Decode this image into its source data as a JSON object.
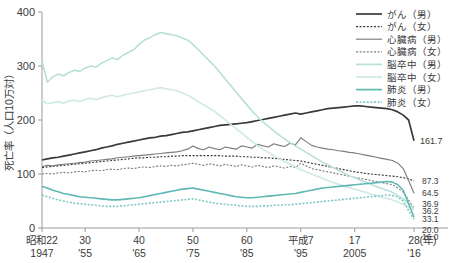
{
  "chart_data": {
    "type": "line",
    "title": "",
    "xlabel": "(年)",
    "ylabel": "死亡率（人口10万対）",
    "ylim": [
      0,
      400
    ],
    "yticks": [
      0,
      100,
      200,
      300,
      400
    ],
    "ytick_labels": [
      "0",
      "100",
      "200",
      "300",
      "400"
    ],
    "grid": false,
    "legend_position": "top-right",
    "xlim": [
      1947,
      2016
    ],
    "xticks": [
      1947,
      1955,
      1965,
      1975,
      1985,
      1995,
      2005,
      2016
    ],
    "xtick_labels_era": [
      "昭和22",
      "30",
      "40",
      "50",
      "60",
      "平成7",
      "17",
      "28"
    ],
    "xtick_labels_western": [
      "1947",
      "'55",
      "'65",
      "'75",
      "'85",
      "'95",
      "2005",
      "'16"
    ],
    "xaxis_unit": "(年)",
    "x": [
      1947,
      1948,
      1949,
      1950,
      1951,
      1952,
      1953,
      1954,
      1955,
      1956,
      1957,
      1958,
      1959,
      1960,
      1961,
      1962,
      1963,
      1964,
      1965,
      1966,
      1967,
      1968,
      1969,
      1970,
      1971,
      1972,
      1973,
      1974,
      1975,
      1976,
      1977,
      1978,
      1979,
      1980,
      1981,
      1982,
      1983,
      1984,
      1985,
      1986,
      1987,
      1988,
      1989,
      1990,
      1991,
      1992,
      1993,
      1994,
      1995,
      1996,
      1997,
      1998,
      1999,
      2000,
      2001,
      2002,
      2003,
      2004,
      2005,
      2006,
      2007,
      2008,
      2009,
      2010,
      2011,
      2012,
      2013,
      2014,
      2015,
      2016
    ],
    "series": [
      {
        "name": "がん（男）",
        "label": "がん（男）",
        "sex": "男",
        "disease": "がん",
        "color": "#3a3a3a",
        "style": "solid",
        "end_value": 161.7,
        "end_label": "161.7",
        "values": [
          126,
          128,
          130,
          131,
          133,
          135,
          137,
          139,
          141,
          143,
          145,
          148,
          150,
          152,
          155,
          157,
          159,
          161,
          163,
          165,
          167,
          168,
          170,
          171,
          173,
          175,
          177,
          178,
          180,
          182,
          184,
          186,
          188,
          190,
          191,
          192,
          193,
          194,
          195,
          197,
          199,
          201,
          203,
          205,
          207,
          209,
          211,
          213,
          211,
          213,
          215,
          217,
          219,
          221,
          222,
          223,
          224,
          225,
          226,
          226,
          225,
          224,
          223,
          222,
          221,
          219,
          215,
          209,
          200,
          161.7
        ]
      },
      {
        "name": "がん（女）",
        "label": "がん（女）",
        "sex": "女",
        "disease": "がん",
        "color": "#3a3a3a",
        "style": "dotted",
        "end_value": 87.3,
        "end_label": "87.3",
        "values": [
          112,
          113,
          114,
          115,
          116,
          117,
          118,
          119,
          120,
          121,
          122,
          123,
          124,
          125,
          126,
          127,
          128,
          129,
          130,
          130,
          131,
          131,
          132,
          132,
          133,
          133,
          134,
          134,
          134,
          134,
          134,
          134,
          134,
          134,
          133,
          133,
          133,
          132,
          132,
          131,
          131,
          130,
          130,
          129,
          128,
          127,
          126,
          125,
          124,
          122,
          120,
          118,
          116,
          114,
          112,
          110,
          108,
          106,
          104,
          103,
          101,
          100,
          99,
          98,
          97,
          96,
          95,
          93,
          91,
          87.3
        ]
      },
      {
        "name": "心臓病（男）",
        "label": "心臓病（男）",
        "sex": "男",
        "disease": "心臓病",
        "color": "#7d7d7d",
        "style": "solid",
        "end_value": 64.5,
        "end_label": "64.5",
        "values": [
          114,
          116,
          115,
          117,
          118,
          119,
          120,
          121,
          122,
          124,
          125,
          126,
          127,
          128,
          130,
          131,
          132,
          133,
          134,
          135,
          136,
          137,
          138,
          139,
          140,
          141,
          143,
          146,
          152,
          147,
          145,
          150,
          147,
          145,
          150,
          148,
          146,
          152,
          150,
          148,
          155,
          152,
          150,
          156,
          153,
          151,
          157,
          154,
          167,
          160,
          153,
          150,
          148,
          146,
          145,
          143,
          142,
          140,
          139,
          137,
          135,
          133,
          131,
          129,
          127,
          125,
          120,
          110,
          88,
          64.5
        ]
      },
      {
        "name": "心臓病（女）",
        "label": "心臓病（女）",
        "sex": "女",
        "disease": "心臓病",
        "color": "#7d7d7d",
        "style": "dotted",
        "end_value": 36.9,
        "end_label": "36.9",
        "values": [
          100,
          101,
          100,
          102,
          103,
          102,
          104,
          105,
          104,
          106,
          107,
          106,
          108,
          109,
          108,
          110,
          111,
          110,
          112,
          113,
          112,
          114,
          115,
          114,
          116,
          115,
          117,
          118,
          120,
          118,
          116,
          119,
          117,
          115,
          118,
          116,
          114,
          117,
          115,
          113,
          116,
          114,
          112,
          115,
          113,
          111,
          114,
          112,
          120,
          115,
          110,
          108,
          106,
          104,
          102,
          100,
          98,
          96,
          94,
          92,
          90,
          88,
          86,
          84,
          82,
          80,
          74,
          66,
          52,
          36.9
        ]
      },
      {
        "name": "脳卒中（男）",
        "label": "脳卒中（男）",
        "sex": "男",
        "disease": "脳卒中",
        "color": "#b7e0d8",
        "style": "solid",
        "end_value": 36.2,
        "end_label": "36.2",
        "values": [
          310,
          270,
          280,
          285,
          282,
          288,
          292,
          290,
          296,
          300,
          298,
          305,
          310,
          315,
          312,
          320,
          325,
          330,
          340,
          348,
          352,
          358,
          362,
          360,
          358,
          356,
          352,
          348,
          340,
          330,
          320,
          310,
          300,
          288,
          276,
          264,
          252,
          240,
          228,
          216,
          206,
          196,
          188,
          180,
          172,
          165,
          158,
          152,
          146,
          140,
          134,
          128,
          122,
          117,
          112,
          107,
          102,
          97,
          93,
          89,
          85,
          81,
          77,
          73,
          70,
          66,
          60,
          54,
          45,
          36.2
        ]
      },
      {
        "name": "脳卒中（女）",
        "label": "脳卒中（女）",
        "sex": "女",
        "disease": "脳卒中",
        "color": "#cfe9e3",
        "style": "solid",
        "end_value": 33.1,
        "end_label": "33.1",
        "values": [
          237,
          230,
          232,
          234,
          231,
          235,
          237,
          234,
          238,
          240,
          238,
          241,
          244,
          246,
          243,
          246,
          248,
          250,
          252,
          254,
          256,
          258,
          260,
          258,
          256,
          254,
          250,
          246,
          240,
          234,
          228,
          222,
          216,
          208,
          200,
          192,
          184,
          176,
          168,
          160,
          152,
          146,
          140,
          134,
          128,
          123,
          118,
          113,
          108,
          104,
          100,
          96,
          92,
          88,
          84,
          81,
          78,
          75,
          72,
          69,
          66,
          63,
          60,
          57,
          55,
          52,
          48,
          44,
          38,
          33.1
        ]
      },
      {
        "name": "肺炎（男）",
        "label": "肺炎（男）",
        "sex": "男",
        "disease": "肺炎",
        "color": "#5fb8b4",
        "style": "solid",
        "end_value": 20.0,
        "end_label": "20.0",
        "values": [
          77,
          74,
          70,
          67,
          64,
          62,
          60,
          58,
          57,
          56,
          55,
          54,
          53,
          52,
          52,
          53,
          54,
          55,
          56,
          58,
          60,
          62,
          64,
          66,
          68,
          70,
          72,
          73,
          74,
          72,
          70,
          68,
          66,
          64,
          62,
          60,
          58,
          57,
          56,
          56,
          57,
          58,
          59,
          60,
          61,
          62,
          63,
          64,
          66,
          68,
          70,
          72,
          74,
          75,
          76,
          77,
          78,
          79,
          80,
          81,
          82,
          83,
          84,
          85,
          86,
          85,
          80,
          70,
          45,
          20.0
        ]
      },
      {
        "name": "肺炎（女）",
        "label": "肺炎（女）",
        "sex": "女",
        "disease": "肺炎",
        "color": "#7fc9c4",
        "style": "dotted",
        "end_value": 16.0,
        "end_label": "16.0",
        "values": [
          61,
          58,
          55,
          52,
          50,
          48,
          46,
          45,
          44,
          43,
          42,
          41,
          40,
          40,
          40,
          41,
          42,
          43,
          44,
          45,
          46,
          47,
          48,
          49,
          50,
          51,
          52,
          53,
          54,
          52,
          50,
          48,
          46,
          45,
          44,
          43,
          42,
          41,
          40,
          40,
          40,
          41,
          41,
          42,
          42,
          43,
          43,
          44,
          45,
          46,
          47,
          48,
          49,
          50,
          51,
          52,
          53,
          54,
          55,
          56,
          57,
          58,
          59,
          60,
          61,
          60,
          57,
          50,
          32,
          16.0
        ]
      }
    ]
  },
  "legend": {
    "items": [
      {
        "label": "がん（男）"
      },
      {
        "label": "がん（女）"
      },
      {
        "label": "心臓病（男）"
      },
      {
        "label": "心臓病（女）"
      },
      {
        "label": "脳卒中（男）"
      },
      {
        "label": "脳卒中（女）"
      },
      {
        "label": "肺炎（男）"
      },
      {
        "label": "肺炎（女）"
      }
    ]
  }
}
